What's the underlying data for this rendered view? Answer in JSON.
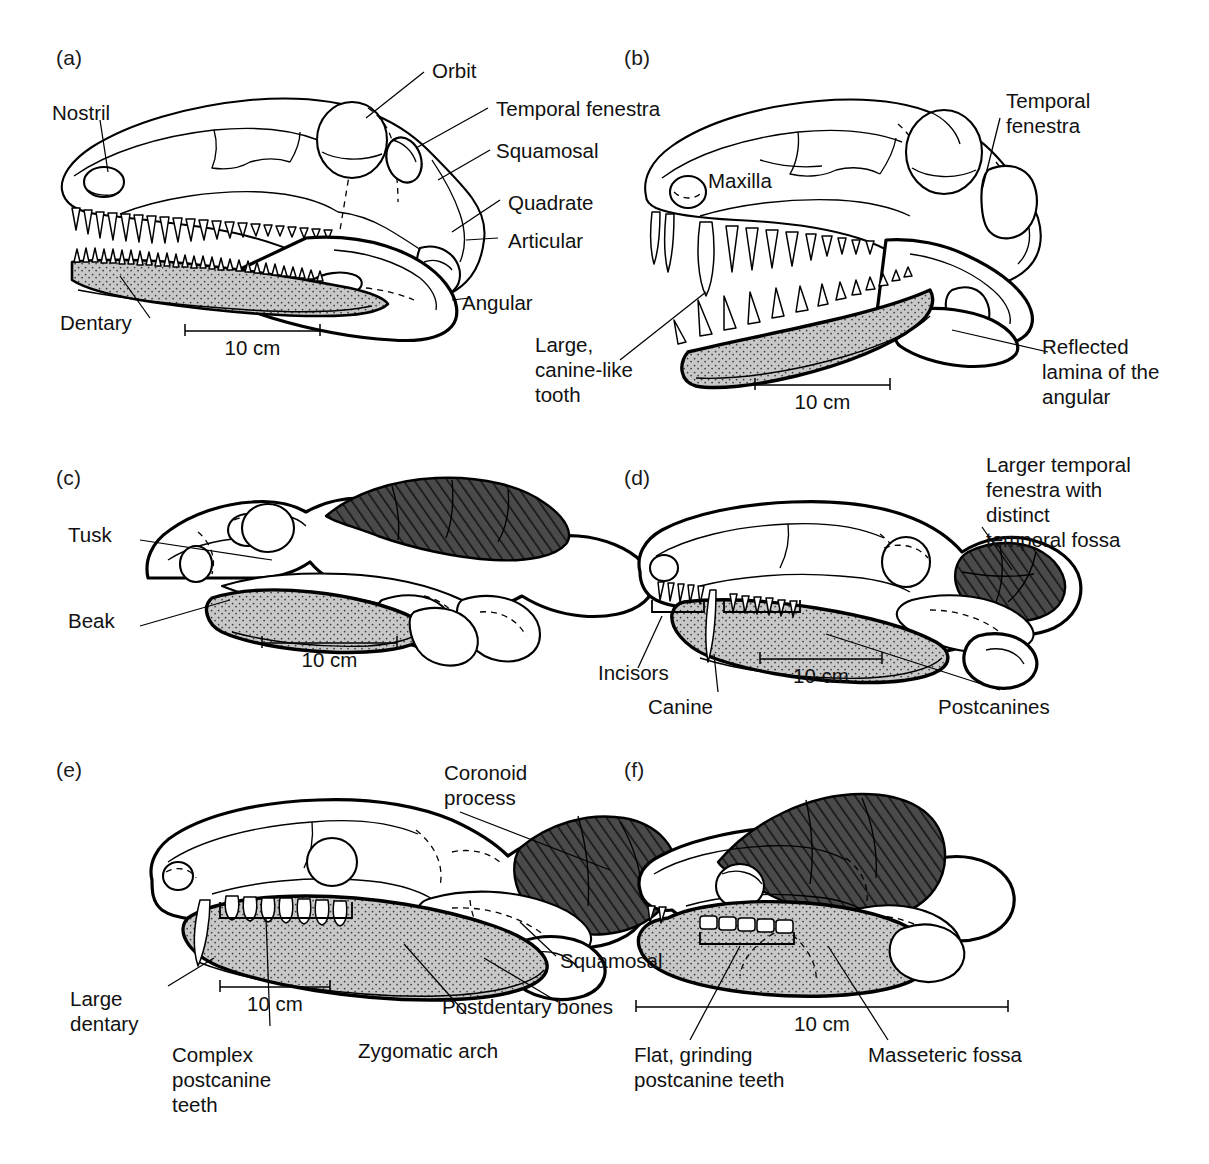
{
  "figure": {
    "width": 1209,
    "height": 1164,
    "background_color": "#ffffff",
    "line_color": "#000000",
    "dentary_fill_color": "#c8c8c8",
    "dark_fenestra_color": "#4a4a4a",
    "hatch_color": "#000000"
  },
  "scale_label": "10 cm",
  "panels": [
    {
      "letter": "(a)",
      "scalebar": "10 cm",
      "labels": [
        "Nostril",
        "Orbit",
        "Temporal fenestra",
        "Squamosal",
        "Quadrate",
        "Articular",
        "Angular",
        "Dentary"
      ]
    },
    {
      "letter": "(b)",
      "scalebar": "10 cm",
      "labels": [
        "Temporal\nfenestra",
        "Maxilla",
        "Large,\ncanine-like\ntooth",
        "Reflected\nlamina of the\nangular"
      ]
    },
    {
      "letter": "(c)",
      "scalebar": "10 cm",
      "labels": [
        "Tusk",
        "Beak"
      ]
    },
    {
      "letter": "(d)",
      "scalebar": "10 cm",
      "labels": [
        "Larger temporal\nfenestra with\ndistinct\ntemporal fossa",
        "Incisors",
        "Canine",
        "Postcanines"
      ]
    },
    {
      "letter": "(e)",
      "scalebar": "10 cm",
      "labels": [
        "Coronoid\nprocess",
        "Squamosal",
        "Postdentary bones",
        "Zygomatic arch",
        "Large\ndentary",
        "Complex\npostcanine\nteeth"
      ]
    },
    {
      "letter": "(f)",
      "scalebar": "10 cm",
      "labels": [
        "Flat, grinding\npostcanine teeth",
        "Masseteric fossa"
      ]
    }
  ],
  "panel_a": {
    "letter": "(a)",
    "nostril": "Nostril",
    "orbit": "Orbit",
    "temporal_fenestra": "Temporal fenestra",
    "squamosal": "Squamosal",
    "quadrate": "Quadrate",
    "articular": "Articular",
    "angular": "Angular",
    "dentary": "Dentary",
    "scale": "10 cm"
  },
  "panel_b": {
    "letter": "(b)",
    "temporal_fenestra": "Temporal\nfenestra",
    "maxilla": "Maxilla",
    "canine_tooth": "Large,\ncanine-like\ntooth",
    "reflected_lamina": "Reflected\nlamina of the\nangular",
    "scale": "10 cm"
  },
  "panel_c": {
    "letter": "(c)",
    "tusk": "Tusk",
    "beak": "Beak",
    "scale": "10 cm"
  },
  "panel_d": {
    "letter": "(d)",
    "larger_fenestra": "Larger temporal\nfenestra with\ndistinct\ntemporal fossa",
    "incisors": "Incisors",
    "canine": "Canine",
    "postcanines": "Postcanines",
    "scale": "10 cm"
  },
  "panel_e": {
    "letter": "(e)",
    "coronoid_process": "Coronoid\nprocess",
    "squamosal": "Squamosal",
    "postdentary_bones": "Postdentary bones",
    "zygomatic_arch": "Zygomatic arch",
    "large_dentary": "Large\ndentary",
    "complex_postcanine": "Complex\npostcanine\nteeth",
    "scale": "10 cm"
  },
  "panel_f": {
    "letter": "(f)",
    "flat_grinding": "Flat, grinding\npostcanine teeth",
    "masseteric_fossa": "Masseteric fossa",
    "scale": "10 cm"
  }
}
